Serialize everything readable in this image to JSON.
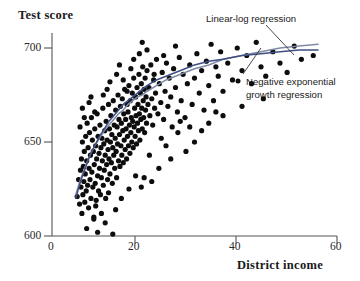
{
  "chart_data": {
    "type": "scatter",
    "title": "",
    "xlabel": "District income",
    "ylabel": "Test score",
    "xlim": [
      0,
      60
    ],
    "ylim": [
      600,
      710
    ],
    "xticks": [
      0,
      20,
      40,
      60
    ],
    "yticks": [
      600,
      650,
      700
    ],
    "grid": false,
    "legend_position": "inline-annotations",
    "annotations": [
      {
        "name": "linear-log-regression",
        "text": "Linear-log regression",
        "x": 206,
        "y": 14
      },
      {
        "name": "negative-exponential-growth-regression",
        "line1": "Negative exponential",
        "line2": "growth regression",
        "x": 246,
        "y": 76
      }
    ],
    "series": [
      {
        "name": "Districts",
        "type": "scatter",
        "marker": "filled-circle",
        "color": "#0d0d0d",
        "points": [
          [
            5.3,
            621
          ],
          [
            5.6,
            630
          ],
          [
            5.8,
            617
          ],
          [
            6.0,
            635
          ],
          [
            6.1,
            626
          ],
          [
            6.2,
            641
          ],
          [
            6.3,
            612
          ],
          [
            6.4,
            650
          ],
          [
            6.5,
            622
          ],
          [
            6.6,
            637
          ],
          [
            6.7,
            629
          ],
          [
            6.8,
            645
          ],
          [
            6.9,
            618
          ],
          [
            7.0,
            633
          ],
          [
            7.1,
            653
          ],
          [
            7.2,
            624
          ],
          [
            7.3,
            640
          ],
          [
            7.4,
            660
          ],
          [
            7.5,
            627
          ],
          [
            7.6,
            647
          ],
          [
            7.7,
            615
          ],
          [
            7.8,
            636
          ],
          [
            7.9,
            655
          ],
          [
            8.0,
            630
          ],
          [
            8.1,
            643
          ],
          [
            8.2,
            620
          ],
          [
            8.3,
            663
          ],
          [
            8.4,
            634
          ],
          [
            8.5,
            651
          ],
          [
            8.6,
            626
          ],
          [
            8.7,
            645
          ],
          [
            8.8,
            610
          ],
          [
            8.9,
            638
          ],
          [
            9.0,
            657
          ],
          [
            9.1,
            628
          ],
          [
            9.2,
            648
          ],
          [
            9.3,
            619
          ],
          [
            9.4,
            641
          ],
          [
            9.5,
            665
          ],
          [
            9.6,
            632
          ],
          [
            9.7,
            653
          ],
          [
            9.8,
            624
          ],
          [
            9.9,
            644
          ],
          [
            10.0,
            636
          ],
          [
            10.1,
            659
          ],
          [
            10.2,
            622
          ],
          [
            10.3,
            647
          ],
          [
            10.4,
            631
          ],
          [
            10.5,
            652
          ],
          [
            10.6,
            640
          ],
          [
            10.7,
            668
          ],
          [
            10.8,
            627
          ],
          [
            10.9,
            649
          ],
          [
            11.0,
            635
          ],
          [
            11.1,
            656
          ],
          [
            11.2,
            643
          ],
          [
            11.3,
            620
          ],
          [
            11.4,
            661
          ],
          [
            11.5,
            638
          ],
          [
            11.6,
            651
          ],
          [
            11.7,
            630
          ],
          [
            11.8,
            646
          ],
          [
            11.9,
            670
          ],
          [
            12.0,
            641
          ],
          [
            12.1,
            657
          ],
          [
            12.2,
            633
          ],
          [
            12.3,
            650
          ],
          [
            12.4,
            664
          ],
          [
            12.5,
            639
          ],
          [
            12.6,
            654
          ],
          [
            12.7,
            628
          ],
          [
            12.8,
            647
          ],
          [
            12.9,
            672
          ],
          [
            13.0,
            643
          ],
          [
            13.1,
            659
          ],
          [
            13.2,
            636
          ],
          [
            13.3,
            652
          ],
          [
            13.4,
            667
          ],
          [
            13.5,
            645
          ],
          [
            13.6,
            631
          ],
          [
            13.7,
            658
          ],
          [
            13.8,
            649
          ],
          [
            13.9,
            675
          ],
          [
            14.0,
            640
          ],
          [
            14.1,
            662
          ],
          [
            14.2,
            654
          ],
          [
            14.3,
            637
          ],
          [
            14.4,
            669
          ],
          [
            14.5,
            648
          ],
          [
            14.6,
            660
          ],
          [
            14.7,
            643
          ],
          [
            14.8,
            673
          ],
          [
            14.9,
            656
          ],
          [
            15.0,
            639
          ],
          [
            15.1,
            665
          ],
          [
            15.2,
            651
          ],
          [
            15.3,
            678
          ],
          [
            15.4,
            646
          ],
          [
            15.5,
            662
          ],
          [
            15.6,
            657
          ],
          [
            15.7,
            641
          ],
          [
            15.8,
            670
          ],
          [
            15.9,
            653
          ],
          [
            16.0,
            666
          ],
          [
            16.1,
            648
          ],
          [
            16.2,
            680
          ],
          [
            16.3,
            659
          ],
          [
            16.4,
            644
          ],
          [
            16.5,
            672
          ],
          [
            16.6,
            655
          ],
          [
            16.7,
            663
          ],
          [
            16.8,
            650
          ],
          [
            16.9,
            676
          ],
          [
            17.0,
            661
          ],
          [
            17.1,
            647
          ],
          [
            17.2,
            684
          ],
          [
            17.3,
            658
          ],
          [
            17.4,
            668
          ],
          [
            17.5,
            653
          ],
          [
            17.6,
            674
          ],
          [
            17.7,
            664
          ],
          [
            17.8,
            649
          ],
          [
            17.9,
            679
          ],
          [
            18.0,
            660
          ],
          [
            18.1,
            670
          ],
          [
            18.2,
            656
          ],
          [
            18.3,
            686
          ],
          [
            18.4,
            665
          ],
          [
            18.5,
            651
          ],
          [
            18.6,
            676
          ],
          [
            18.7,
            662
          ],
          [
            18.8,
            681
          ],
          [
            18.9,
            668
          ],
          [
            19.0,
            657
          ],
          [
            19.1,
            690
          ],
          [
            19.2,
            672
          ],
          [
            19.3,
            663
          ],
          [
            19.4,
            678
          ],
          [
            19.5,
            655
          ],
          [
            19.6,
            684
          ],
          [
            19.7,
            667
          ],
          [
            19.8,
            674
          ],
          [
            19.9,
            660
          ],
          [
            20.0,
            688
          ],
          [
            20.2,
            670
          ],
          [
            20.4,
            679
          ],
          [
            20.6,
            664
          ],
          [
            20.8,
            691
          ],
          [
            21.0,
            673
          ],
          [
            21.2,
            659
          ],
          [
            21.4,
            683
          ],
          [
            21.6,
            668
          ],
          [
            21.8,
            676
          ],
          [
            22.0,
            694
          ],
          [
            22.3,
            665
          ],
          [
            22.6,
            681
          ],
          [
            22.9,
            671
          ],
          [
            23.2,
            687
          ],
          [
            23.5,
            662
          ],
          [
            23.8,
            677
          ],
          [
            24.1,
            692
          ],
          [
            24.4,
            669
          ],
          [
            24.7,
            684
          ],
          [
            25.0,
            674
          ],
          [
            25.3,
            658
          ],
          [
            25.6,
            689
          ],
          [
            26.0,
            679
          ],
          [
            26.4,
            666
          ],
          [
            26.8,
            695
          ],
          [
            27.2,
            672
          ],
          [
            27.6,
            686
          ],
          [
            28.0,
            663
          ],
          [
            28.5,
            681
          ],
          [
            29.0,
            691
          ],
          [
            29.5,
            670
          ],
          [
            30.0,
            684
          ],
          [
            30.5,
            697
          ],
          [
            31.0,
            676
          ],
          [
            31.5,
            688
          ],
          [
            32.0,
            667
          ],
          [
            32.5,
            693
          ],
          [
            33.0,
            680
          ],
          [
            33.5,
            702
          ],
          [
            34.0,
            672
          ],
          [
            34.5,
            690
          ],
          [
            35.0,
            685
          ],
          [
            35.5,
            698
          ],
          [
            36.0,
            677
          ],
          [
            37.0,
            692
          ],
          [
            38.0,
            683
          ],
          [
            39.0,
            700
          ],
          [
            40.0,
            688
          ],
          [
            41.0,
            696
          ],
          [
            42.0,
            681
          ],
          [
            43.0,
            703
          ],
          [
            44.0,
            690
          ],
          [
            45.0,
            685
          ],
          [
            46.5,
            698
          ],
          [
            48.0,
            692
          ],
          [
            49.5,
            687
          ],
          [
            51.0,
            701
          ],
          [
            52.5,
            694
          ],
          [
            55.0,
            696
          ],
          [
            7.3,
            604
          ],
          [
            9.6,
            602
          ],
          [
            11.2,
            607
          ],
          [
            12.8,
            601
          ],
          [
            10.4,
            612
          ],
          [
            8.8,
            609
          ],
          [
            13.4,
            614
          ],
          [
            9.2,
            616
          ],
          [
            14.6,
            620
          ],
          [
            16.2,
            625
          ],
          [
            11.9,
            623
          ],
          [
            19.4,
            631
          ],
          [
            22.5,
            636
          ],
          [
            21.0,
            629
          ],
          [
            25.0,
            641
          ],
          [
            24.0,
            648
          ],
          [
            28.2,
            645
          ],
          [
            17.6,
            632
          ],
          [
            18.8,
            626
          ],
          [
            20.5,
            643
          ],
          [
            23.0,
            652
          ],
          [
            26.5,
            655
          ],
          [
            30.0,
            650
          ],
          [
            33.0,
            660
          ],
          [
            36.0,
            664
          ],
          [
            40.0,
            669
          ],
          [
            44.5,
            673
          ],
          [
            29.0,
            658
          ],
          [
            31.5,
            656
          ],
          [
            34.5,
            666
          ],
          [
            27.0,
            661
          ],
          [
            12.2,
            682
          ],
          [
            13.6,
            686
          ],
          [
            15.0,
            683
          ],
          [
            16.6,
            689
          ],
          [
            14.2,
            691
          ],
          [
            17.2,
            694
          ],
          [
            18.4,
            697
          ],
          [
            11.6,
            678
          ],
          [
            20.0,
            699
          ],
          [
            21.5,
            686
          ],
          [
            23.5,
            696
          ],
          [
            26.0,
            701
          ],
          [
            19.0,
            703
          ],
          [
            15.8,
            677
          ],
          [
            10.8,
            675
          ],
          [
            6.4,
            668
          ],
          [
            7.8,
            671
          ],
          [
            9.0,
            666
          ],
          [
            8.2,
            674
          ],
          [
            5.9,
            658
          ],
          [
            6.8,
            663
          ]
        ]
      },
      {
        "name": "Linear-log regression",
        "type": "line",
        "color": "#7e8aa6",
        "points": [
          [
            5.0,
            622
          ],
          [
            6,
            630
          ],
          [
            7,
            637
          ],
          [
            8,
            643
          ],
          [
            9,
            648
          ],
          [
            10,
            652
          ],
          [
            11,
            656
          ],
          [
            12,
            659
          ],
          [
            13,
            662
          ],
          [
            14,
            665
          ],
          [
            15,
            667
          ],
          [
            16,
            670
          ],
          [
            17,
            672
          ],
          [
            18,
            674
          ],
          [
            19,
            675
          ],
          [
            20,
            677
          ],
          [
            22,
            680
          ],
          [
            24,
            683
          ],
          [
            26,
            685
          ],
          [
            28,
            687
          ],
          [
            30,
            689
          ],
          [
            33,
            691
          ],
          [
            36,
            694
          ],
          [
            40,
            696
          ],
          [
            44,
            698
          ],
          [
            48,
            700
          ],
          [
            52,
            701
          ],
          [
            56,
            702
          ]
        ]
      },
      {
        "name": "Negative exponential growth regression",
        "type": "line",
        "color": "#3f4f82",
        "points": [
          [
            5.0,
            620
          ],
          [
            6,
            629
          ],
          [
            7,
            636
          ],
          [
            8,
            643
          ],
          [
            9,
            648
          ],
          [
            10,
            653
          ],
          [
            11,
            657
          ],
          [
            12,
            661
          ],
          [
            13,
            664
          ],
          [
            14,
            667
          ],
          [
            15,
            670
          ],
          [
            16,
            672
          ],
          [
            17,
            674
          ],
          [
            18,
            676
          ],
          [
            19,
            678
          ],
          [
            20,
            680
          ],
          [
            22,
            683
          ],
          [
            24,
            685
          ],
          [
            26,
            687
          ],
          [
            28,
            689
          ],
          [
            30,
            691
          ],
          [
            33,
            693
          ],
          [
            36,
            694
          ],
          [
            40,
            696
          ],
          [
            44,
            697
          ],
          [
            48,
            698
          ],
          [
            52,
            699
          ],
          [
            56,
            699
          ]
        ]
      }
    ]
  },
  "axes": {
    "ylabel_text": "Test score",
    "xlabel_text": "District income",
    "ytick_labels": [
      "700",
      "650",
      "600"
    ],
    "xtick_labels": [
      "0",
      "20",
      "40",
      "60"
    ],
    "axis_color": "#555555"
  },
  "annotations": {
    "linear_log": "Linear-log regression",
    "neg_exp_line1": "Negative exponential",
    "neg_exp_line2": "growth regression"
  }
}
